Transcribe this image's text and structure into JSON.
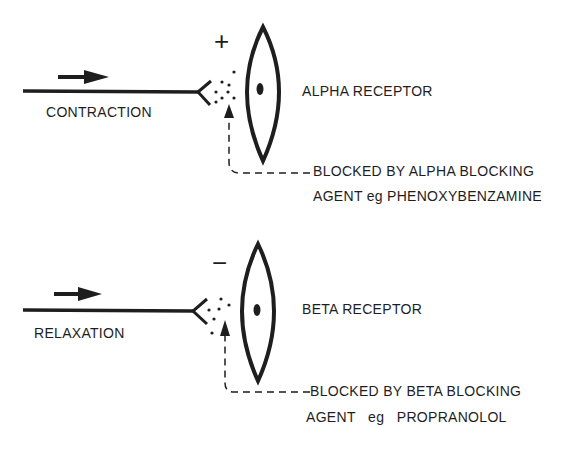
{
  "diagram": {
    "alpha": {
      "sign": "+",
      "effect_label": "CONTRACTION",
      "receptor_label": "ALPHA RECEPTOR",
      "blocked_line1": "BLOCKED BY ALPHA BLOCKING",
      "blocked_line2": "AGENT eg PHENOXYBENZAMINE"
    },
    "beta": {
      "sign": "−",
      "effect_label": "RELAXATION",
      "receptor_label": "BETA RECEPTOR",
      "blocked_line1": "BLOCKED BY BETA BLOCKING",
      "blocked_line2": "AGENT   eg   PROPRANOLOL"
    },
    "colors": {
      "ink": "#1e1e1e",
      "background": "#ffffff"
    }
  }
}
